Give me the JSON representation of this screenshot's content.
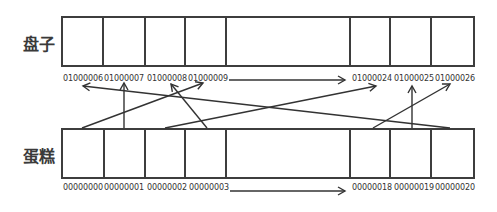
{
  "rows": {
    "plate": {
      "label": "盘子",
      "cells": [
        {
          "address": "01000006",
          "width": 41
        },
        {
          "address": "01000007",
          "width": 42
        },
        {
          "address": "01000008",
          "width": 41
        },
        {
          "address": "01000009",
          "width": 41
        },
        {
          "address": "",
          "width": 124
        },
        {
          "address": "01000024",
          "width": 41
        },
        {
          "address": "01000025",
          "width": 41
        },
        {
          "address": "01000026",
          "width": 42
        }
      ]
    },
    "cake": {
      "label": "蛋糕",
      "cells": [
        {
          "address": "00000000",
          "width": 41
        },
        {
          "address": "00000001",
          "width": 42
        },
        {
          "address": "00000002",
          "width": 41
        },
        {
          "address": "00000003",
          "width": 41
        },
        {
          "address": "",
          "width": 124
        },
        {
          "address": "00000018",
          "width": 41
        },
        {
          "address": "00000019",
          "width": 41
        },
        {
          "address": "00000020",
          "width": 42
        }
      ]
    }
  },
  "mappings": [
    {
      "from": "00000000",
      "to": "01000009"
    },
    {
      "from": "00000001",
      "to": "01000007"
    },
    {
      "from": "00000002",
      "to": "01000024"
    },
    {
      "from": "00000003",
      "to": "01000008"
    },
    {
      "from": "00000018",
      "to": "01000026"
    },
    {
      "from": "00000019",
      "to": "01000025"
    },
    {
      "from": "00000020",
      "to": "01000006"
    }
  ],
  "colors": {
    "line": "#333333",
    "border": "#3d3d3d",
    "text": "#333333"
  }
}
